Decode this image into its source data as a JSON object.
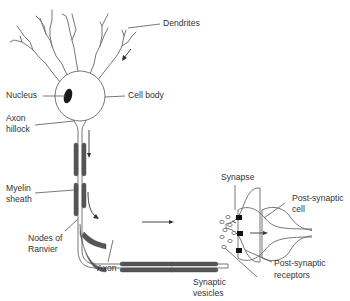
{
  "diagram": {
    "labels": {
      "dendrites": "Dendrites",
      "nucleus": "Nucleus",
      "cell_body": "Cell body",
      "axon_hillock_1": "Axon",
      "axon_hillock_2": "hillock",
      "myelin_sheath_1": "Myelin",
      "myelin_sheath_2": "sheath",
      "nodes_of_ranvier_1": "Nodes of",
      "nodes_of_ranvier_2": "Ranvier",
      "axon": "Axon",
      "synapse": "Synapse",
      "post_synaptic_cell_1": "Post-synaptic",
      "post_synaptic_cell_2": "cell",
      "synaptic_vesicles_1": "Synaptic",
      "synaptic_vesicles_2": "vesicles",
      "post_synaptic_receptors_1": "Post-synaptic",
      "post_synaptic_receptors_2": "receptors"
    },
    "colors": {
      "outline": "#666666",
      "myelin": "#555555",
      "text": "#333333",
      "background": "#ffffff"
    }
  }
}
